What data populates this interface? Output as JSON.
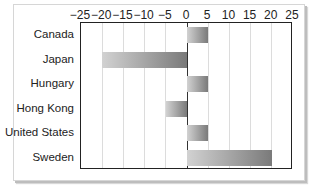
{
  "chart_data": {
    "type": "bar",
    "orientation": "horizontal",
    "title": "",
    "xlabel": "",
    "ylabel": "",
    "categories": [
      "Canada",
      "Japan",
      "Hungary",
      "Hong Kong",
      "United States",
      "Sweden"
    ],
    "values": [
      5,
      -20,
      5,
      -5,
      5,
      20
    ],
    "xlim": [
      -25,
      25
    ],
    "x_ticks": [
      -25,
      -20,
      -15,
      -10,
      -5,
      0,
      5,
      10,
      15,
      20,
      25
    ],
    "x_tick_labels": [
      "−25",
      "−20",
      "−15",
      "−10",
      "−5",
      "0",
      "5",
      "10",
      "15",
      "20",
      "25"
    ],
    "x_axis_position": "top",
    "grid": {
      "vertical": true,
      "horizontal": false
    },
    "legend": null,
    "bar_fill": "gradient light-to-dark gray"
  },
  "colors": {
    "bar_light": "#d2d2d2",
    "bar_dark": "#7a7a7a",
    "gridline": "#dcdcdc",
    "axis": "#222222"
  }
}
